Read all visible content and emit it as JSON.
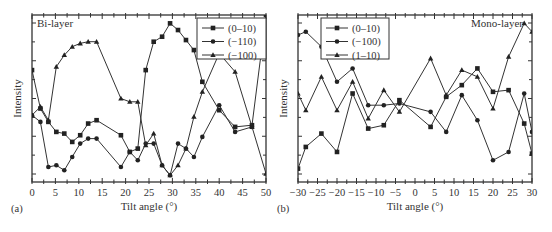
{
  "chart_data": [
    {
      "type": "line",
      "panel_label": "(a)",
      "annotation": "Bi-layer",
      "title": "",
      "xlabel": "Tilt angle (°)",
      "ylabel": "Intensity",
      "xlim": [
        0,
        50
      ],
      "ylim": [
        0,
        10
      ],
      "x_ticks": [
        0,
        5,
        10,
        15,
        20,
        25,
        30,
        35,
        40,
        45,
        50
      ],
      "y_ticks_labeled": false,
      "legend_position": "upper right",
      "series": [
        {
          "name": "(0–10)",
          "marker": "square",
          "x": [
            0,
            1.8,
            3.5,
            5.2,
            6.9,
            8.6,
            10.3,
            12.0,
            13.8,
            19.0,
            20.9,
            22.6,
            24.3,
            26.0,
            27.8,
            29.5,
            31.2,
            32.9,
            34.6,
            36.4,
            40.0,
            43.4,
            47.0,
            50.0
          ],
          "y": [
            6.7,
            4.4,
            3.6,
            3.0,
            2.9,
            2.4,
            2.8,
            3.5,
            3.7,
            2.8,
            1.8,
            2.0,
            6.7,
            8.4,
            8.7,
            9.5,
            9.1,
            8.5,
            7.9,
            6.0,
            4.3,
            3.3,
            3.4,
            10.0
          ]
        },
        {
          "name": "(−110)",
          "marker": "circle",
          "x": [
            0,
            1.8,
            3.5,
            5.2,
            6.9,
            8.6,
            10.3,
            12.0,
            13.8,
            19.0,
            20.9,
            22.6,
            24.3,
            26.0,
            27.8,
            29.5,
            31.2,
            32.9,
            34.6,
            36.4,
            40.0,
            43.4,
            47.0
          ],
          "y": [
            4.0,
            3.6,
            0.9,
            1.0,
            0.7,
            1.5,
            2.3,
            2.6,
            2.6,
            0.9,
            1.8,
            1.3,
            2.3,
            2.3,
            1.0,
            0.4,
            2.3,
            2.0,
            1.5,
            2.7,
            4.6,
            3.0,
            3.3
          ]
        },
        {
          "name": "(−100)",
          "marker": "triangle",
          "x": [
            0,
            1.8,
            3.5,
            5.2,
            6.9,
            8.6,
            10.3,
            12.0,
            13.8,
            19.0,
            20.9,
            22.6,
            24.3,
            26.0,
            27.8,
            29.5,
            31.2,
            32.9,
            34.6,
            36.4,
            40.0,
            43.4,
            47.0,
            50.0
          ],
          "y": [
            4.0,
            4.5,
            3.7,
            6.9,
            7.6,
            8.1,
            8.3,
            8.4,
            8.4,
            5.0,
            4.8,
            4.8,
            2.2,
            2.9,
            1.0,
            0.4,
            1.0,
            2.0,
            3.9,
            5.4,
            7.7,
            6.6,
            3.3,
            0.5
          ]
        }
      ]
    },
    {
      "type": "line",
      "panel_label": "(b)",
      "annotation": "Mono-layer",
      "title": "",
      "xlabel": "Tilt angle (°)",
      "ylabel": "Intensity",
      "xlim": [
        -30,
        30
      ],
      "ylim": [
        0,
        10
      ],
      "x_ticks": [
        -30,
        -25,
        -20,
        -15,
        -10,
        -5,
        0,
        5,
        10,
        15,
        20,
        25,
        30
      ],
      "y_ticks_labeled": false,
      "legend_position": "upper left",
      "series": [
        {
          "name": "(0–10)",
          "marker": "square",
          "x": [
            -30,
            -28,
            -24,
            -20,
            -16,
            -12,
            -8,
            -4,
            4,
            8,
            12,
            16,
            20,
            24,
            28,
            30
          ],
          "y": [
            0.8,
            2.1,
            2.9,
            1.8,
            5.3,
            3.2,
            3.4,
            4.9,
            3.3,
            5.1,
            5.8,
            6.8,
            5.4,
            5.5,
            3.5,
            1.7
          ],
          "note": "series also includes additional points; approximate"
        },
        {
          "name": "(−100)",
          "marker": "circle",
          "x": [
            -30,
            -28,
            -24,
            -20,
            -16,
            -12,
            -8,
            -4,
            4,
            8,
            12,
            16,
            20,
            24,
            28,
            30
          ],
          "y": [
            8.8,
            9.0,
            8.1,
            6.0,
            6.8,
            4.6,
            4.6,
            4.7,
            4.2,
            3.0,
            5.2,
            3.7,
            1.3,
            1.8,
            5.3,
            3.0
          ]
        },
        {
          "name": "(1–10)",
          "marker": "triangle",
          "x": [
            -30,
            -28,
            -24,
            -20,
            -16,
            -12,
            -8,
            -4,
            4,
            8,
            12,
            16,
            20,
            24,
            28,
            30
          ],
          "y": [
            5.3,
            4.3,
            6.3,
            4.3,
            6.0,
            3.8,
            5.5,
            4.2,
            7.4,
            5.2,
            6.7,
            6.3,
            4.4,
            7.5,
            9.5,
            9.0
          ]
        }
      ]
    }
  ],
  "panels": {
    "a": {
      "label": "(a)",
      "annotation": "Bi-layer",
      "xlabel": "Tilt angle (°)",
      "ylabel": "Intensity",
      "legend": [
        "(0–10)",
        "(−110)",
        "(−100)"
      ],
      "tick_labels": [
        "0",
        "5",
        "10",
        "15",
        "20",
        "25",
        "30",
        "35",
        "40",
        "45",
        "50"
      ]
    },
    "b": {
      "label": "(b)",
      "annotation": "Mono-layer",
      "xlabel": "Tilt angle (°)",
      "ylabel": "Intensity",
      "legend": [
        "(0–10)",
        "(−100)",
        "(1–10)"
      ],
      "tick_labels": [
        "−30",
        "−25",
        "−20",
        "−15",
        "−10",
        "−5",
        "0",
        "5",
        "10",
        "15",
        "20",
        "25",
        "30"
      ]
    }
  }
}
